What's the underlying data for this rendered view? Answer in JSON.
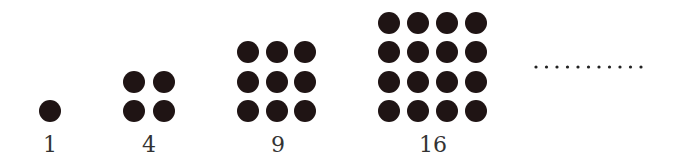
{
  "figure": {
    "dot_color": "#1f1414",
    "label_color": "#333333",
    "groups": [
      {
        "label": "1",
        "size": 1,
        "cx": [
          50
        ],
        "cy": [
          111
        ],
        "label_x": 50
      },
      {
        "label": "4",
        "size": 2,
        "cx": [
          134,
          164
        ],
        "cy": [
          82,
          111
        ],
        "label_x": 149
      },
      {
        "label": "9",
        "size": 3,
        "cx": [
          248,
          277,
          305
        ],
        "cy": [
          52,
          82,
          111
        ],
        "label_x": 278
      },
      {
        "label": "16",
        "size": 4,
        "cx": [
          389,
          418,
          447,
          476
        ],
        "cy": [
          23,
          52,
          82,
          111
        ],
        "label_x": 433
      }
    ],
    "continuation": {
      "text": "...........",
      "dot_count": 11,
      "x_start": 536,
      "x_end": 641,
      "y": 67
    }
  }
}
